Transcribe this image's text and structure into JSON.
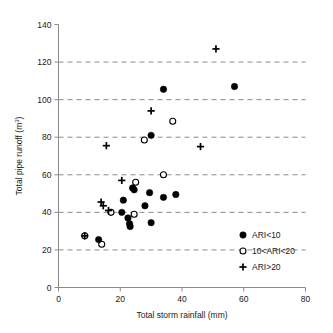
{
  "chart_data": {
    "type": "scatter",
    "title": "",
    "xlabel": "Total storm rainfall (mm)",
    "ylabel": "Total pipe runoff (m3)",
    "ylabel_display": "Total pipe runoff (m",
    "ylabel_superscript": "3",
    "ylabel_suffix": ")",
    "xlim": [
      0,
      80
    ],
    "ylim": [
      0,
      140
    ],
    "xticks": [
      0,
      20,
      40,
      60,
      80
    ],
    "yticks": [
      0,
      20,
      40,
      60,
      80,
      100,
      120,
      140
    ],
    "xtick_labels": [
      "0",
      "20",
      "40",
      "60",
      "80"
    ],
    "ytick_labels": [
      "0",
      "20",
      "40",
      "60",
      "80",
      "100",
      "120",
      "140"
    ],
    "grid": "horizontal-dashed",
    "grid_values": [
      20,
      40,
      60,
      80,
      100,
      120
    ],
    "legend_position": "bottom-right",
    "series": [
      {
        "name": "ARI<10",
        "marker": "filled-circle",
        "color": "#000000",
        "points": [
          {
            "x": 13.0,
            "y": 25.5
          },
          {
            "x": 20.5,
            "y": 40.0
          },
          {
            "x": 21.0,
            "y": 46.5
          },
          {
            "x": 22.5,
            "y": 37.0
          },
          {
            "x": 23.0,
            "y": 34.0
          },
          {
            "x": 23.2,
            "y": 32.5
          },
          {
            "x": 24.0,
            "y": 53.0
          },
          {
            "x": 24.5,
            "y": 52.0
          },
          {
            "x": 28.0,
            "y": 43.5
          },
          {
            "x": 29.5,
            "y": 50.5
          },
          {
            "x": 30.0,
            "y": 34.5
          },
          {
            "x": 30.0,
            "y": 81.0
          },
          {
            "x": 34.0,
            "y": 48.0
          },
          {
            "x": 34.0,
            "y": 105.5
          },
          {
            "x": 38.0,
            "y": 49.5
          },
          {
            "x": 57.0,
            "y": 107.0
          }
        ]
      },
      {
        "name": "10<ARI<20",
        "marker": "open-circle",
        "color": "#000000",
        "points": [
          {
            "x": 8.5,
            "y": 27.5
          },
          {
            "x": 14.0,
            "y": 23.0
          },
          {
            "x": 17.0,
            "y": 40.0
          },
          {
            "x": 24.5,
            "y": 39.0
          },
          {
            "x": 25.0,
            "y": 56.0
          },
          {
            "x": 27.8,
            "y": 78.5
          },
          {
            "x": 34.0,
            "y": 60.0
          },
          {
            "x": 37.0,
            "y": 88.5
          }
        ]
      },
      {
        "name": "ARI>20",
        "marker": "plus",
        "color": "#000000",
        "points": [
          {
            "x": 8.5,
            "y": 27.5
          },
          {
            "x": 13.8,
            "y": 45.5
          },
          {
            "x": 14.5,
            "y": 43.5
          },
          {
            "x": 15.5,
            "y": 75.5
          },
          {
            "x": 16.2,
            "y": 41.0
          },
          {
            "x": 20.5,
            "y": 57.0
          },
          {
            "x": 30.0,
            "y": 94.0
          },
          {
            "x": 46.0,
            "y": 75.0
          },
          {
            "x": 51.0,
            "y": 127.0
          }
        ]
      }
    ],
    "legend_entries": [
      {
        "label": "ARI<10",
        "marker": "filled-circle"
      },
      {
        "label": "10<ARI<20",
        "marker": "open-circle"
      },
      {
        "label": "ARI>20",
        "marker": "plus"
      }
    ]
  }
}
